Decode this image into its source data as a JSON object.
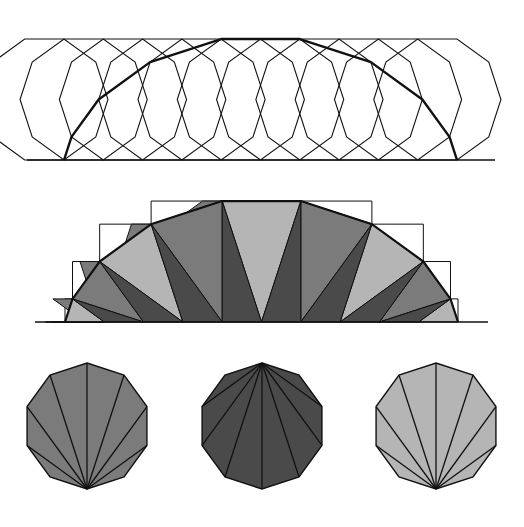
{
  "figure": {
    "width": 524,
    "height": 527,
    "colors": {
      "background": "#ffffff",
      "stroke": "#111111",
      "light": "#b5b5b5",
      "medium": "#7b7b7b",
      "dark": "#4a4a4a",
      "gap": "#ffffff"
    },
    "decagon": {
      "sides": 10,
      "side_length": 39.3
    },
    "panels": [
      {
        "id": "rolling",
        "label": "Decagon rolling along a line",
        "baseline_y": 160,
        "baseline_x": [
          27,
          495
        ],
        "first_contact_x": 64,
        "positions": 11,
        "path_style": "bold"
      },
      {
        "id": "fan-unrolled",
        "label": "Area under the vertex path split into fan triangles",
        "baseline_y": 322,
        "first_contact_x": 65,
        "steps": 10,
        "shade_cycle": [
          "medium",
          "dark",
          "light"
        ]
      },
      {
        "id": "decagons",
        "label": "Three fan-triangulated decagons",
        "items": [
          {
            "cx": 87,
            "fan_apex": "bottom",
            "fill": "medium"
          },
          {
            "cx": 262,
            "fan_apex": "top",
            "fill": "dark"
          },
          {
            "cx": 436,
            "fan_apex": "bottom",
            "fill": "light"
          }
        ],
        "top_y": 363,
        "bottom_y": 489
      }
    ]
  }
}
